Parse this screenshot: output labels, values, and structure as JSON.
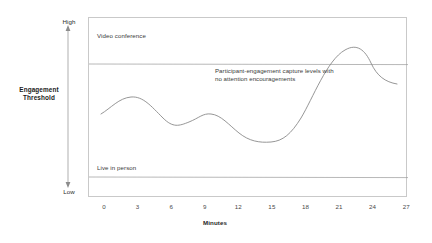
{
  "axes": {
    "y_top_label": "High",
    "y_bottom_label": "Low",
    "y_axis_title_line1": "Engagement",
    "y_axis_title_line2": "Threshold",
    "x_axis_title": "Minutes"
  },
  "labels": {
    "video_conference": "Video conference",
    "live_in_person": "Live in person",
    "annotation_line1": "Participant-engagement capture levels with",
    "annotation_line2": "no attention encouragements"
  },
  "colors": {
    "curve": "#8a8a8a",
    "reference_line": "#9a9a9a",
    "frame": "#c9c9c9",
    "axis_arrow": "#8c8c8c",
    "text": "#3a3a3a",
    "text_bold": "#1a1a1a"
  },
  "chart_data": {
    "type": "line",
    "title": "",
    "xlabel": "Minutes",
    "ylabel": "Engagement Threshold",
    "xlim": [
      0,
      28.5
    ],
    "ylim": [
      0,
      1
    ],
    "grid": false,
    "legend": "none",
    "x_ticks": [
      0,
      3,
      6,
      9,
      12,
      15,
      18,
      21,
      24,
      27
    ],
    "y_tick_labels": [
      "Low",
      "High"
    ],
    "series": [
      {
        "name": "Video conference threshold",
        "type": "reference-line",
        "orientation": "horizontal",
        "value": 0.745,
        "label": "Video conference"
      },
      {
        "name": "Live in person threshold",
        "type": "reference-line",
        "orientation": "horizontal",
        "value": 0.118,
        "label": "Live in person"
      },
      {
        "name": "Participant-engagement capture levels with no attention encouragements",
        "type": "curve",
        "x": [
          0,
          1.5,
          3,
          4.5,
          6,
          7.5,
          9,
          10.5,
          12,
          13.5,
          15,
          16.5,
          18,
          19.5,
          21,
          22.5,
          24,
          25.5,
          27
        ],
        "y": [
          0.47,
          0.53,
          0.58,
          0.57,
          0.51,
          0.43,
          0.38,
          0.42,
          0.47,
          0.45,
          0.38,
          0.3,
          0.25,
          0.3,
          0.47,
          0.72,
          0.86,
          0.82,
          0.63
        ]
      }
    ],
    "annotations": [
      {
        "text": "Participant-engagement capture levels with no attention encouragements",
        "x": 11.5,
        "y": 0.69
      }
    ]
  }
}
